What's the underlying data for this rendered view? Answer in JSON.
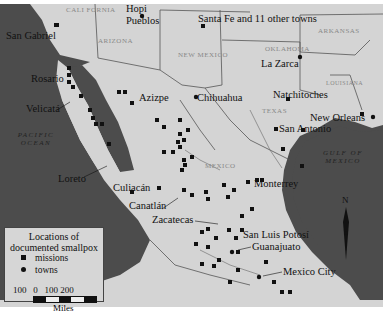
{
  "map": {
    "title": "Locations of documented smallpox",
    "towns": [
      {
        "name": "San Gabriel",
        "x": 6,
        "y": 36,
        "type": "mission"
      },
      {
        "name": "Hopi Pueblos",
        "x": 145,
        "y": 14,
        "type": "town"
      },
      {
        "name": "Santa Fe and 11 other towns",
        "x": 199,
        "y": 18,
        "type": "mission"
      },
      {
        "name": "La Zarca",
        "x": 283,
        "y": 63,
        "type": "town"
      },
      {
        "name": "Rosario",
        "x": 30,
        "y": 77,
        "type": "mission"
      },
      {
        "name": "Natchitoches",
        "x": 272,
        "y": 93,
        "type": "mission"
      },
      {
        "name": "Velicatá",
        "x": 24,
        "y": 107,
        "type": "mission"
      },
      {
        "name": "Azizpe",
        "x": 140,
        "y": 101,
        "type": "mission"
      },
      {
        "name": "Chihuahua",
        "x": 199,
        "y": 97,
        "type": "town"
      },
      {
        "name": "New Orleans",
        "x": 313,
        "y": 114,
        "type": "town"
      },
      {
        "name": "San Antonio",
        "x": 281,
        "y": 127,
        "type": "mission"
      },
      {
        "name": "Loreto",
        "x": 60,
        "y": 177,
        "type": "mission"
      },
      {
        "name": "Culiacán",
        "x": 113,
        "y": 186,
        "type": "mission"
      },
      {
        "name": "Monterrey",
        "x": 254,
        "y": 183,
        "type": "mission"
      },
      {
        "name": "Canatlán",
        "x": 129,
        "y": 204,
        "type": "mission"
      },
      {
        "name": "Zacatecas",
        "x": 152,
        "y": 218,
        "type": "mission"
      },
      {
        "name": "San Luis Potosí",
        "x": 242,
        "y": 233,
        "type": "mission"
      },
      {
        "name": "Guanajuato",
        "x": 252,
        "y": 245,
        "type": "town"
      },
      {
        "name": "Mexico City",
        "x": 283,
        "y": 271,
        "type": "town"
      }
    ],
    "regions": [
      {
        "name": "CALI FORNIA",
        "x": 68,
        "y": 8
      },
      {
        "name": "ARIZONA",
        "x": 105,
        "y": 38
      },
      {
        "name": "NEW MEXICO",
        "x": 180,
        "y": 55
      },
      {
        "name": "OKLAHOMA",
        "x": 270,
        "y": 48
      },
      {
        "name": "ARKANSAS",
        "x": 320,
        "y": 28
      },
      {
        "name": "LOUISIANA",
        "x": 330,
        "y": 75
      },
      {
        "name": "TEXAS",
        "x": 262,
        "y": 112
      },
      {
        "name": "MEXICO",
        "x": 207,
        "y": 162
      }
    ],
    "oceans": [
      {
        "name": "PACIFIC OCEAN",
        "x": 10,
        "y": 133
      },
      {
        "name": "GULF OF MEXICO",
        "x": 315,
        "y": 155
      }
    ],
    "compass_label": "N",
    "legend": {
      "title_line1": "Locations of",
      "title_line2": "documented smallpox",
      "missions_label": "missions",
      "towns_label": "towns",
      "scale_ticks": "100   0   100 200",
      "scale_unit": "Miles"
    },
    "colors": {
      "land": "#d4d4d4",
      "water": "#4a4a4a",
      "border": "#555555"
    }
  }
}
